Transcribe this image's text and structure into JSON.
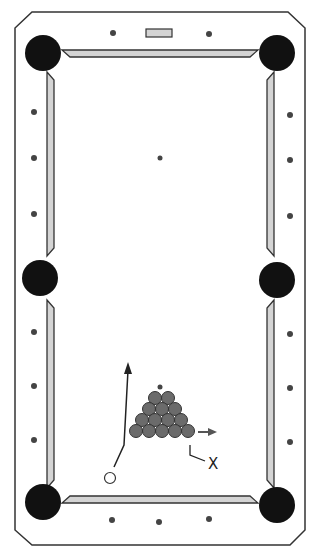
{
  "diagram": {
    "label_x": "X",
    "colors": {
      "rail": "#333333",
      "cushion": "#d4d4d4",
      "pocket": "#111111",
      "ball": "#6b6b6b",
      "cue_ball": "#ffffff",
      "diamond": "#444444"
    },
    "rack_rows": [
      2,
      3,
      4,
      5
    ],
    "pockets": 6,
    "diamonds_per_long_side": 6,
    "diamonds_per_short_side": 3
  }
}
